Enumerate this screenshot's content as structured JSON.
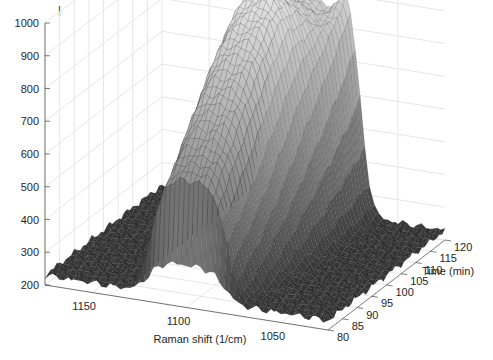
{
  "chart_data": {
    "type": "surface3d",
    "title": "",
    "xlabel": "Raman shift (1/cm)",
    "ylabel": "Time (min)",
    "zlabel": "",
    "x_ticks": [
      "1150",
      "1100",
      "1050"
    ],
    "y_ticks": [
      "80",
      "85",
      "90",
      "95",
      "100",
      "105",
      "110",
      "115",
      "120"
    ],
    "z_ticks": [
      "200",
      "300",
      "400",
      "500",
      "600",
      "700",
      "800",
      "900",
      "1000"
    ],
    "xlim": [
      1025,
      1175
    ],
    "ylim": [
      80,
      120
    ],
    "zlim": [
      200,
      1000
    ],
    "x_reversed": true,
    "grid": true,
    "colormap": "gray",
    "baseline": 230,
    "peaks": [
      {
        "name": "broad-band",
        "center": 1100,
        "width": 22,
        "height_range": [
          600,
          760
        ],
        "time_profile": "plateau"
      },
      {
        "name": "narrow-band",
        "center": 1075,
        "width": 8,
        "height": 500,
        "peak_time": 120
      }
    ],
    "surface_mesh": {
      "x_points": 60,
      "y_points": 40
    }
  },
  "marker": "|"
}
